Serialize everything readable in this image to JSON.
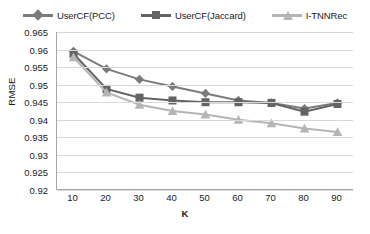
{
  "chart_data": {
    "type": "line",
    "title": "",
    "xlabel": "K",
    "ylabel": "RMSE",
    "x": [
      10,
      20,
      30,
      40,
      50,
      60,
      70,
      80,
      90
    ],
    "xlim": [
      5,
      95
    ],
    "ylim": [
      0.92,
      0.965
    ],
    "ytick_labels": [
      "0.965",
      "0.96",
      "0.955",
      "0.95",
      "0.945",
      "0.94",
      "0.935",
      "0.93",
      "0.925",
      "0.92"
    ],
    "ytick_values": [
      0.965,
      0.96,
      0.955,
      0.95,
      0.945,
      0.94,
      0.935,
      0.93,
      0.925,
      0.92
    ],
    "xtick_labels": [
      "10",
      "20",
      "30",
      "40",
      "50",
      "60",
      "70",
      "80",
      "90"
    ],
    "grid": true,
    "legend_position": "top-center",
    "series": [
      {
        "name": "UserCF(PCC)",
        "marker": "diamond",
        "color": "#7b7b7b",
        "values": [
          0.9595,
          0.9545,
          0.9515,
          0.9495,
          0.9475,
          0.9455,
          0.9448,
          0.9432,
          0.9448
        ]
      },
      {
        "name": "UserCF(Jaccard)",
        "marker": "square",
        "color": "#636363",
        "values": [
          0.9588,
          0.9488,
          0.9463,
          0.9455,
          0.945,
          0.945,
          0.9448,
          0.9423,
          0.9445
        ]
      },
      {
        "name": "I-TNNRec",
        "marker": "triangle",
        "color": "#b5b5b5",
        "values": [
          0.9578,
          0.9478,
          0.9443,
          0.9425,
          0.9415,
          0.94,
          0.939,
          0.9375,
          0.9365
        ]
      }
    ]
  },
  "legend": {
    "items": [
      {
        "label": "UserCF(PCC)"
      },
      {
        "label": "UserCF(Jaccard)"
      },
      {
        "label": "I-TNNRec"
      }
    ]
  },
  "axes": {
    "y_title": "RMSE",
    "x_title": "K"
  }
}
